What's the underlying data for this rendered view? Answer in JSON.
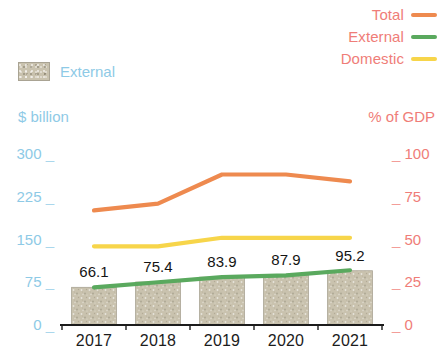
{
  "legend_right": {
    "items": [
      {
        "label": "Total",
        "color": "#ee8a4f",
        "swatch": "line-swatch"
      },
      {
        "label": "External",
        "color": "#5aa95e",
        "swatch": "line-swatch"
      },
      {
        "label": "Domestic",
        "color": "#f7d54a",
        "swatch": "line-swatch"
      }
    ],
    "label_color": "#ef7d78"
  },
  "legend_left": {
    "label": "External",
    "label_color": "#8ecae6",
    "swatch_color": "#c9c2ae",
    "swatch": "bar-swatch"
  },
  "axes": {
    "left": {
      "title": "$ billion",
      "color": "#8ecae6",
      "ticks": [
        "300",
        "225",
        "150",
        "75",
        "0"
      ],
      "min": 0,
      "max": 300
    },
    "right": {
      "title": "% of GDP",
      "color": "#ef7d78",
      "ticks": [
        "100",
        "75",
        "50",
        "25",
        "0"
      ],
      "min": 0,
      "max": 100
    },
    "x": {
      "labels": [
        "2017",
        "2018",
        "2019",
        "2020",
        "2021"
      ],
      "color": "#1c1c1c"
    }
  },
  "bar_labels": [
    "66.1",
    "75.4",
    "83.9",
    "87.9",
    "95.2"
  ],
  "colors": {
    "bar_fill": "#c9c2ae",
    "bar_edge": "#a9a393",
    "total_line": "#ee8a4f",
    "external_line": "#5aa95e",
    "domestic_line": "#f7d54a",
    "axis_line": "#1c1c1c",
    "background": "#ffffff"
  },
  "chart_data": {
    "type": "bar",
    "title": "",
    "xlabel": "",
    "ylabel": "$ billion",
    "categories": [
      "2017",
      "2018",
      "2019",
      "2020",
      "2021"
    ],
    "grid": false,
    "legend_position": "top-right",
    "bars": {
      "name": "External",
      "unit": "$ billion",
      "axis": "left",
      "ylim": [
        0,
        300
      ],
      "yticks": [
        0,
        75,
        150,
        225,
        300
      ],
      "values": [
        66.1,
        75.4,
        83.9,
        87.9,
        95.2
      ],
      "data_labels": [
        "66.1",
        "75.4",
        "83.9",
        "87.9",
        "95.2"
      ],
      "color": "#c9c2ae"
    },
    "series": [
      {
        "name": "Total",
        "type": "line",
        "unit": "% of GDP",
        "axis": "right",
        "values": [
          67,
          71,
          88,
          88,
          84
        ],
        "color": "#ee8a4f"
      },
      {
        "name": "External",
        "type": "line",
        "unit": "% of GDP",
        "axis": "right",
        "values": [
          22,
          25,
          28,
          29,
          32
        ],
        "color": "#5aa95e"
      },
      {
        "name": "Domestic",
        "type": "line",
        "unit": "% of GDP",
        "axis": "right",
        "values": [
          46,
          46,
          51,
          51,
          51
        ],
        "color": "#f7d54a"
      }
    ],
    "right_axis": {
      "label": "% of GDP",
      "ylim": [
        0,
        100
      ],
      "yticks": [
        0,
        25,
        50,
        75,
        100
      ]
    }
  }
}
